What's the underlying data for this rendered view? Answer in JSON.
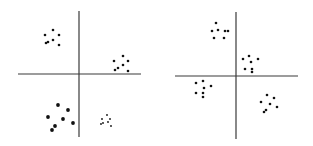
{
  "figure": {
    "colors": {
      "axis": "#3a3a3a",
      "point": "#111111",
      "background": "#ffffff"
    },
    "panels": [
      {
        "name": "left-panel",
        "clusters": [
          {
            "quadrant": "top-left",
            "size": "small",
            "points": [
              [
                -34,
                39
              ],
              [
                -26,
                44
              ],
              [
                -20,
                39
              ],
              [
                -33,
                31
              ],
              [
                -31,
                32
              ],
              [
                -26,
                34
              ],
              [
                -20,
                29
              ]
            ]
          },
          {
            "quadrant": "top-right",
            "size": "small",
            "points": [
              [
                35,
                13
              ],
              [
                44,
                18
              ],
              [
                49,
                13
              ],
              [
                36,
                4
              ],
              [
                39,
                6
              ],
              [
                44,
                9
              ],
              [
                49,
                3
              ]
            ]
          },
          {
            "quadrant": "bottom-left",
            "size": "large",
            "points": [
              [
                -21,
                -31
              ],
              [
                -11,
                -36
              ],
              [
                -31,
                -43
              ],
              [
                -16,
                -45
              ],
              [
                -6,
                -49
              ],
              [
                -24,
                -52
              ],
              [
                -27,
                -56
              ]
            ]
          },
          {
            "quadrant": "bottom-right",
            "size": "tiny",
            "points": [
              [
                28,
                -41
              ],
              [
                31,
                -45
              ],
              [
                23,
                -45
              ],
              [
                29,
                -48
              ],
              [
                22,
                -50
              ],
              [
                24,
                -49
              ],
              [
                32,
                -52
              ]
            ]
          }
        ]
      },
      {
        "name": "right-panel",
        "clusters": [
          {
            "quadrant": "top-left",
            "size": "small",
            "points": [
              [
                -20,
                53
              ],
              [
                -24,
                45
              ],
              [
                -18,
                46
              ],
              [
                -11,
                45
              ],
              [
                -8,
                45
              ],
              [
                -22,
                38
              ],
              [
                -12,
                38
              ]
            ]
          },
          {
            "quadrant": "top-right",
            "size": "small",
            "points": [
              [
                7,
                17
              ],
              [
                13,
                20
              ],
              [
                15,
                14
              ],
              [
                22,
                17
              ],
              [
                9,
                7
              ],
              [
                16,
                7
              ],
              [
                16,
                4
              ]
            ]
          },
          {
            "quadrant": "bottom-left",
            "size": "small",
            "points": [
              [
                -40,
                -7
              ],
              [
                -33,
                -5
              ],
              [
                -32,
                -12
              ],
              [
                -25,
                -10
              ],
              [
                -40,
                -17
              ],
              [
                -33,
                -17
              ],
              [
                -33,
                -21
              ]
            ]
          },
          {
            "quadrant": "bottom-right",
            "size": "small",
            "points": [
              [
                31,
                -19
              ],
              [
                38,
                -22
              ],
              [
                25,
                -26
              ],
              [
                34,
                -28
              ],
              [
                41,
                -31
              ],
              [
                30,
                -34
              ],
              [
                28,
                -36
              ]
            ]
          }
        ]
      }
    ]
  }
}
